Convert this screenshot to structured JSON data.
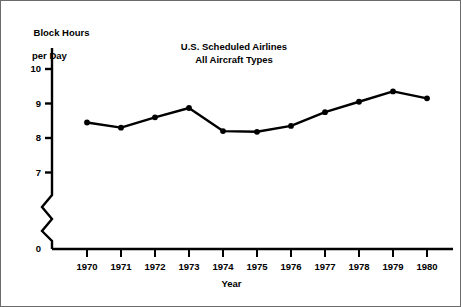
{
  "figure": {
    "background_color": "#ffffff",
    "ink_color": "#000000",
    "border_color": "#6b6b6b"
  },
  "chart_data": {
    "type": "line",
    "title": "U.S. Scheduled Airlines\nAll Aircraft Types",
    "title_lines": [
      "U.S. Scheduled Airlines",
      "All Aircraft Types"
    ],
    "xlabel": "Year",
    "ylabel": "Block Hours\nper Day",
    "ylabel_lines": [
      "Block Hours",
      "per Day"
    ],
    "x": [
      1970,
      1971,
      1972,
      1973,
      1974,
      1975,
      1976,
      1977,
      1978,
      1979,
      1980
    ],
    "categories": [
      "1970",
      "1971",
      "1972",
      "1973",
      "1974",
      "1975",
      "1976",
      "1977",
      "1978",
      "1979",
      "1980"
    ],
    "values": [
      8.45,
      8.3,
      8.6,
      8.87,
      8.2,
      8.18,
      8.35,
      8.75,
      9.05,
      9.35,
      9.15
    ],
    "series": [
      {
        "name": "Block Hours per Day",
        "values": [
          8.45,
          8.3,
          8.6,
          8.87,
          8.2,
          8.18,
          8.35,
          8.75,
          9.05,
          9.35,
          9.15
        ]
      }
    ],
    "xlim": [
      1969.5,
      1980.6
    ],
    "ylim": [
      7.0,
      10.35
    ],
    "ytick_labels": [
      "0",
      "7",
      "8",
      "9",
      "10"
    ],
    "yticks": [
      0,
      7,
      8,
      9,
      10
    ],
    "xtick_labels": [
      "1970",
      "1971",
      "1972",
      "1973",
      "1974",
      "1975",
      "1976",
      "1977",
      "1978",
      "1979",
      "1980"
    ],
    "grid": false,
    "legend": "none",
    "axis_break": {
      "present": true,
      "between": [
        0,
        7
      ],
      "style": "zigzag"
    },
    "marker": "filled-circle",
    "line_width_px": 2.4
  }
}
